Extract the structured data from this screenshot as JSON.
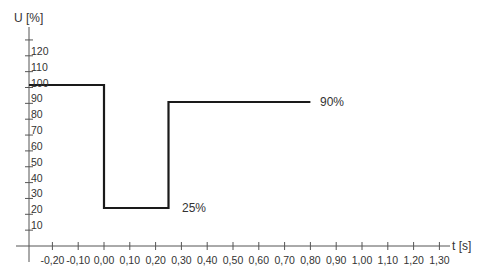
{
  "chart_data": {
    "type": "line",
    "title": "",
    "xlabel": "t [s]",
    "ylabel": "U [%]",
    "xlim": [
      -0.3,
      1.35
    ],
    "ylim": [
      0,
      135
    ],
    "grid": false,
    "legend": null,
    "x_ticks": [
      -0.2,
      -0.1,
      0.0,
      0.1,
      0.2,
      0.3,
      0.4,
      0.5,
      0.6,
      0.7,
      0.8,
      0.9,
      1.0,
      1.1,
      1.2,
      1.3
    ],
    "x_tick_labels": [
      "-0,20",
      "-0,10",
      "0,00",
      "0,10",
      "0,20",
      "0,30",
      "0,40",
      "0,50",
      "0,60",
      "0,70",
      "0,80",
      "0,90",
      "1,00",
      "1,10",
      "1,20",
      "1,30"
    ],
    "y_ticks": [
      10,
      20,
      30,
      40,
      50,
      60,
      70,
      80,
      90,
      100,
      110,
      120,
      130
    ],
    "y_tick_labels": [
      "10",
      "20",
      "30",
      "40",
      "50",
      "60",
      "70",
      "80",
      "90",
      "100",
      "110",
      "120",
      ""
    ],
    "series": [
      {
        "name": "voltage",
        "x": [
          -0.3,
          0.0,
          0.0,
          0.25,
          0.25,
          0.8
        ],
        "y": [
          100,
          100,
          25,
          25,
          90,
          90
        ]
      }
    ],
    "annotations": [
      {
        "text": "25%",
        "x": 0.3,
        "y": 25
      },
      {
        "text": "90%",
        "x": 0.84,
        "y": 90
      }
    ]
  }
}
